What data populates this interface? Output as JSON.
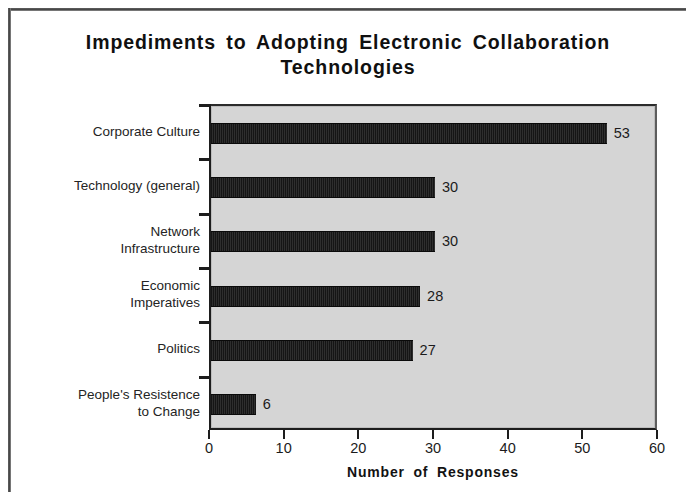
{
  "chart_data": {
    "type": "bar",
    "orientation": "horizontal",
    "title": "Impediments to Adopting Electronic Collaboration Technologies",
    "title_line1": "Impediments to Adopting Electronic Collaboration",
    "title_line2": "Technologies",
    "xlabel": "Number of Responses",
    "ylabel": "",
    "xlim": [
      0,
      60
    ],
    "xticks": [
      0,
      10,
      20,
      30,
      40,
      50,
      60
    ],
    "grid": false,
    "legend": null,
    "categories": [
      "Corporate Culture",
      "Technology (general)",
      "Network\nInfrastructure",
      "Economic\nImperatives",
      "Politics",
      "People's Resistence\nto Change"
    ],
    "values": [
      53,
      30,
      30,
      28,
      27,
      6
    ],
    "value_labels": [
      "53",
      "30",
      "30",
      "28",
      "27",
      "6"
    ],
    "bar_color": "#1a1a1a",
    "plot_background": "#d5d5d5",
    "page_background": "#ffffff"
  }
}
